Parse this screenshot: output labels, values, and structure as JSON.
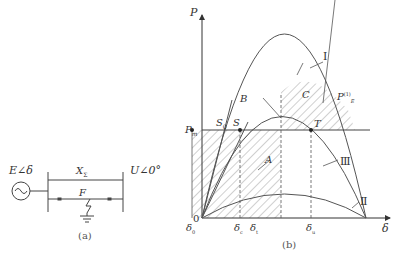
{
  "circuit": {
    "source_label": "E∠δ",
    "bus_label": "U∠0°",
    "reactance_label": "X",
    "reactance_sub": "Σ",
    "fault_label": "F",
    "caption": "(a)"
  },
  "plot": {
    "y_axis_label": "P",
    "x_axis_label": "δ",
    "origin_label": "0",
    "pm_label": "P",
    "pm_sub": "m",
    "curve_labels": {
      "I": "Ⅰ",
      "II": "Ⅱ",
      "III": "Ⅲ",
      "pe": "P",
      "pe_sup": "(1)",
      "pe_sub": "E"
    },
    "points": {
      "S0": "S",
      "S0_sub": "0",
      "S": "S",
      "B": "B",
      "C": "C",
      "T": "T",
      "A": "A"
    },
    "delta_ticks": [
      {
        "label": "δ",
        "sub": "0"
      },
      {
        "label": "δ",
        "sub": "c"
      },
      {
        "label": "δ",
        "sub": "t"
      },
      {
        "label": "δ",
        "sub": "u"
      }
    ],
    "caption": "(b)"
  }
}
